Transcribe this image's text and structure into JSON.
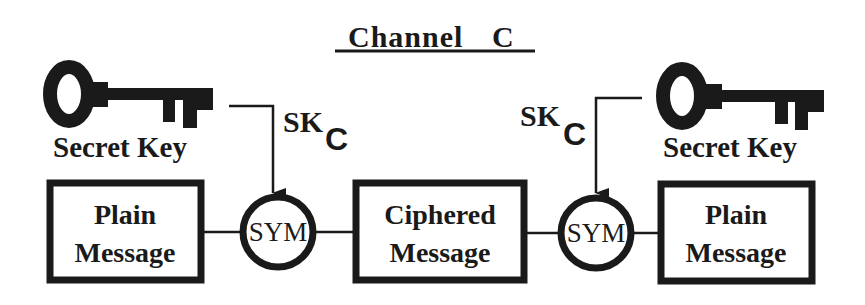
{
  "title": {
    "word": "Channel",
    "letter": "C"
  },
  "left_key": {
    "label": "Secret Key"
  },
  "right_key": {
    "label": "Secret Key"
  },
  "left_session_key": {
    "base": "SK",
    "subscript": "C"
  },
  "right_session_key": {
    "base": "SK",
    "subscript": "C"
  },
  "boxes": [
    {
      "line1": "Plain",
      "line2": "Message"
    },
    {
      "line1": "Ciphered",
      "line2": "Message"
    },
    {
      "line1": "Plain",
      "line2": "Message"
    }
  ],
  "operators": [
    {
      "label": "SYM"
    },
    {
      "label": "SYM"
    }
  ],
  "colors": {
    "ink": "#1a1a1a",
    "background": "#ffffff"
  }
}
